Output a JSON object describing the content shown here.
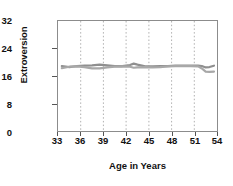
{
  "chart_data": {
    "type": "line",
    "title": "",
    "xlabel": "Age in Years",
    "ylabel": "Extroversion",
    "xlim": [
      33,
      54
    ],
    "ylim": [
      0,
      32
    ],
    "xticks": [
      33,
      36,
      39,
      42,
      45,
      48,
      51,
      54
    ],
    "yticks": [
      0,
      8,
      16,
      24,
      32
    ],
    "grid": "vertical-dotted",
    "legend": "none",
    "series": [
      {
        "name": "series-1",
        "color": "#8f8f8f",
        "x": [
          33.5,
          34.5,
          35.5,
          36.5,
          37.5,
          38.5,
          39.5,
          40.5,
          41.5,
          42.5,
          43.0,
          43.5,
          44.5,
          45.5,
          46.5,
          47.5,
          48.5,
          49.5,
          50.5,
          51.5,
          52.0,
          52.5,
          53.0,
          53.6
        ],
        "y": [
          18.9,
          18.6,
          18.9,
          19.0,
          19.1,
          19.3,
          19.1,
          18.9,
          18.9,
          19.2,
          19.6,
          19.3,
          18.8,
          18.8,
          18.9,
          18.9,
          19.0,
          19.0,
          19.0,
          19.0,
          18.9,
          18.5,
          18.6,
          19.0
        ]
      },
      {
        "name": "series-2",
        "color": "#a8a8a8",
        "x": [
          33.5,
          34.5,
          35.5,
          36.5,
          37.5,
          38.5,
          39.5,
          40.5,
          41.5,
          42.5,
          43.0,
          43.5,
          44.5,
          45.5,
          46.5,
          47.5,
          48.5,
          49.5,
          50.5,
          51.5,
          52.0,
          52.5,
          53.0,
          53.6
        ],
        "y": [
          18.3,
          18.7,
          18.8,
          18.6,
          18.2,
          18.2,
          18.5,
          18.7,
          18.8,
          18.7,
          18.4,
          18.5,
          18.6,
          18.5,
          18.6,
          18.8,
          18.9,
          18.9,
          18.9,
          18.8,
          18.2,
          17.3,
          17.2,
          17.3
        ]
      }
    ]
  },
  "axis": {
    "ylabel_text": "Extroversion",
    "xlabel_text": "Age in Years",
    "ytick_labels": [
      "32",
      "24",
      "16",
      "8",
      "0"
    ],
    "xtick_labels": [
      "33",
      "36",
      "39",
      "42",
      "45",
      "48",
      "51",
      "54"
    ]
  },
  "colors": {
    "frame": "#8c8c8c",
    "grid": "#b0b0b0",
    "text": "#111111",
    "line1": "#8f8f8f",
    "line2": "#a8a8a8"
  }
}
